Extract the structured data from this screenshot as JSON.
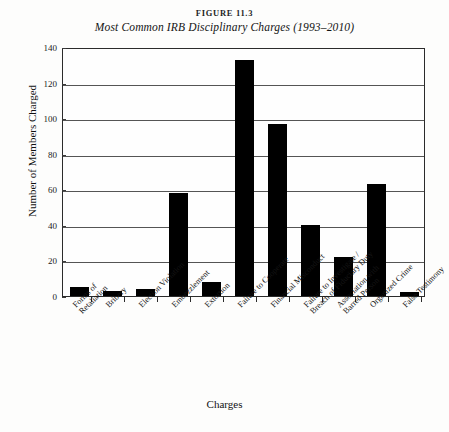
{
  "figure": {
    "number": "FIGURE 11.3",
    "title": "Most Common IRB Disciplinary Charges (1993–2010)"
  },
  "chart_data": {
    "type": "bar",
    "title": "Most Common IRB Disciplinary Charges (1993–2010)",
    "xlabel": "Charges",
    "ylabel": "Number of Members Charged",
    "ylim": [
      0,
      140
    ],
    "ytick_labels": [
      "140",
      "120",
      "100",
      "80",
      "60",
      "40",
      "20",
      "0"
    ],
    "yticks": [
      140,
      120,
      100,
      80,
      60,
      40,
      20,
      0
    ],
    "grid": true,
    "legend": "none",
    "bar_color": "#000000",
    "categories": [
      "Forms of Retaliation",
      "Bribery",
      "Election Violation",
      "Embezzlement",
      "Extortion",
      "Failure to Cooperate",
      "Financial Misconduct",
      "Failure to Investigate / Breach of Fiduciary Duty",
      "Association with Barred Person",
      "Organized Crime",
      "False Testimony"
    ],
    "category_lines": [
      [
        "Forms of",
        "Retaliation"
      ],
      [
        "Bribery"
      ],
      [
        "Election Violation"
      ],
      [
        "Embezzlement"
      ],
      [
        "Extortion"
      ],
      [
        "Failure to Cooperate"
      ],
      [
        "Financial Misconduct"
      ],
      [
        "Failure to Investigate /",
        "Breach of Fiduciary Duty"
      ],
      [
        "Association with",
        "Barred Person"
      ],
      [
        "Organized Crime"
      ],
      [
        "False Testimony"
      ]
    ],
    "values": [
      5,
      3,
      4,
      58,
      8,
      133,
      97,
      40,
      22,
      63,
      2
    ]
  }
}
